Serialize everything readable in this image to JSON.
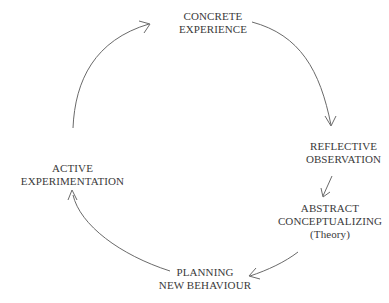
{
  "diagram": {
    "type": "cycle",
    "nodes": [
      {
        "id": "concrete",
        "lines": [
          "CONCRETE",
          "EXPERIENCE"
        ]
      },
      {
        "id": "reflective",
        "lines": [
          "REFLECTIVE",
          "OBSERVATION"
        ]
      },
      {
        "id": "abstract",
        "lines": [
          "ABSTRACT",
          "CONCEPTUALIZING",
          "(Theory)"
        ]
      },
      {
        "id": "planning",
        "lines": [
          "PLANNING",
          "NEW BEHAVIOUR"
        ]
      },
      {
        "id": "active",
        "lines": [
          "ACTIVE",
          "EXPERIMENTATION"
        ]
      }
    ],
    "edges": [
      {
        "from": "concrete",
        "to": "reflective"
      },
      {
        "from": "reflective",
        "to": "abstract"
      },
      {
        "from": "abstract",
        "to": "planning"
      },
      {
        "from": "planning",
        "to": "active"
      },
      {
        "from": "active",
        "to": "concrete"
      }
    ],
    "colors": {
      "text": "#3a3a3a",
      "arrow": "#6a6a6a",
      "background": "#ffffff"
    }
  }
}
